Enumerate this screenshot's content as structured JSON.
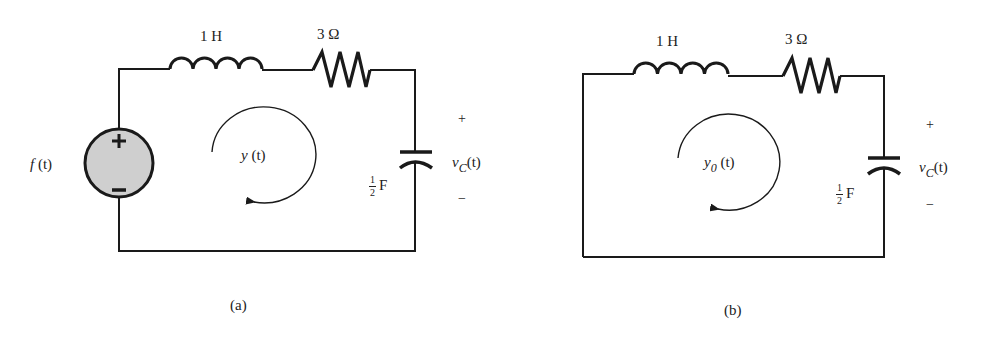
{
  "figure": {
    "colors": {
      "wire": "#1a1a1a",
      "source_fill": "#cfcfcf",
      "text": "#222222"
    },
    "circuit_a": {
      "caption": "(a)",
      "source": {
        "label_fn": "f",
        "label_arg": "(t)",
        "plus": "+",
        "minus": "−"
      },
      "inductor": {
        "label": "1 H"
      },
      "resistor": {
        "label": "3 Ω"
      },
      "capacitor": {
        "num": "1",
        "den": "2",
        "unit": "F"
      },
      "voltage": {
        "plus": "+",
        "minus": "−",
        "var": "v",
        "sub": "C",
        "arg": "(t)"
      },
      "loop_current": {
        "var": "y",
        "sub": "",
        "arg": "(t)"
      }
    },
    "circuit_b": {
      "caption": "(b)",
      "inductor": {
        "label": "1 H"
      },
      "resistor": {
        "label": "3 Ω"
      },
      "capacitor": {
        "num": "1",
        "den": "2",
        "unit": "F"
      },
      "voltage": {
        "plus": "+",
        "minus": "−",
        "var": "v",
        "sub": "C",
        "arg": "(t)"
      },
      "loop_current": {
        "var": "y",
        "sub": "0",
        "arg": "(t)"
      }
    }
  }
}
